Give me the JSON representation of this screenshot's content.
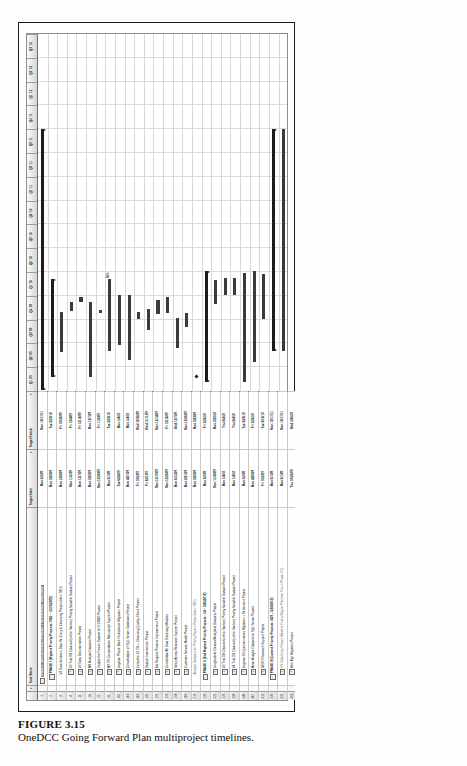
{
  "figure": {
    "label": "FIGURE 3.15",
    "caption": "OneDCC Going Forward Plan multiproject timelines."
  },
  "app": {
    "type": "gantt-chart",
    "columns": {
      "id": "",
      "indicator": "",
      "task_name": "Task Name",
      "target_start": "Target Start",
      "target_finish": "Target Finish"
    },
    "sort_arrow": "▾"
  },
  "timeline": {
    "unit": "quarter",
    "ticks": [
      "Q1 '09",
      "Q2 '09",
      "Q3 '09",
      "Q4 '09",
      "Q1 '10",
      "Q2 '10",
      "Q3 '10",
      "Q4 '10",
      "Q1 '11",
      "Q2 '11",
      "Q3 '11",
      "Q4 '11",
      "Q1 '12",
      "Q2 '12",
      "Q3 '12"
    ]
  },
  "chart_data": {
    "type": "bar",
    "title": "OneDCC Going Forward Plan multiproject timelines",
    "xlabel": "Quarter",
    "ylabel": "Task",
    "categories": [
      "Q1 '09",
      "Q2 '09",
      "Q3 '09",
      "Q4 '09",
      "Q1 '10",
      "Q2 '10",
      "Q3 '10",
      "Q4 '10",
      "Q1 '11",
      "Q2 '11",
      "Q3 '11",
      "Q4 '11",
      "Q1 '12",
      "Q2 '12",
      "Q3 '12"
    ],
    "rows": [
      {
        "id": "1",
        "indent": 0,
        "expander": "-",
        "bold": true,
        "banner": true,
        "name": "OneDCC 2009-2010 MULTIPROJECT INTEGRATED TIMELINES",
        "target_start": "Mon 2/2/09",
        "target_finish": "Mon 10/17/11",
        "start_q": 0.05,
        "end_q": 11.0,
        "kind": "summary"
      },
      {
        "id": "2",
        "indent": 1,
        "expander": "-",
        "bold": true,
        "name": "PHASE I (Highest Priority Projects: 9/26 – 12/19/2009)",
        "target_start": "Mon 3/23/09",
        "target_finish": "Tue 2/23/10",
        "start_q": 0.6,
        "end_q": 4.7,
        "kind": "summary",
        "pct": ""
      },
      {
        "id": "3",
        "indent": 2,
        "expander": "",
        "bold": false,
        "name": "V3 Data Solutions Data Re-Entry & Cleansing Project (New-TBD)",
        "target_start": "Mon 5/28/09",
        "target_finish": "Fri 10/30/09",
        "start_q": 1.62,
        "end_q": 3.32,
        "kind": "bar"
      },
      {
        "id": "4",
        "indent": 2,
        "expander": "+",
        "bold": false,
        "name": "V3 Trial DB Cleaned (within Section) Priority Variable Dataset Project",
        "target_start": "Mon 11/2/09",
        "target_finish": "Fri 12/4/09",
        "start_q": 3.35,
        "end_q": 3.72,
        "kind": "bar"
      },
      {
        "id": "11",
        "indent": 2,
        "expander": "+",
        "bold": false,
        "name": "V3 Data Documentation Project",
        "target_start": "Mon 12/7/09",
        "target_finish": "Fri 12/18/09",
        "start_q": 3.75,
        "end_q": 3.95,
        "kind": "bar"
      },
      {
        "id": "14",
        "indent": 2,
        "expander": "+",
        "bold": false,
        "name": "MB Analytic Datasets Project",
        "target_start": "Mon 3/23/09",
        "target_finish": "Mon 12/7/09",
        "start_q": 0.6,
        "end_q": 3.76,
        "kind": "bar"
      },
      {
        "id": "25",
        "indent": 2,
        "expander": "+",
        "bold": false,
        "name": "Update the Frozen Dataset to 9/1/2009 Project",
        "target_start": "Mon 10/26/09",
        "target_finish": "Fri 11/6/09",
        "start_q": 3.28,
        "end_q": 3.42,
        "kind": "bar"
      },
      {
        "id": "31",
        "indent": 2,
        "expander": "+",
        "bold": false,
        "name": "MR-PII Concordation Manuscript Support Project",
        "target_start": "Mon 6/1/09",
        "target_finish": "Tue 2/23/10",
        "start_q": 1.68,
        "end_q": 4.7,
        "kind": "bar",
        "pct": "95%"
      },
      {
        "id": "83",
        "indent": 2,
        "expander": "+",
        "bold": false,
        "name": "Logician Phone Bank Foreclosure Migration Project",
        "target_start": "Tue 6/26/09",
        "target_finish": "Mon 1/4/10",
        "start_q": 1.95,
        "end_q": 4.02,
        "kind": "bar"
      },
      {
        "id": "102",
        "indent": 2,
        "expander": "+",
        "bold": false,
        "name": "Consolidation of SQL Server Databases Project",
        "target_start": "Mon 4/27/09",
        "target_finish": "Mon 1/4/10",
        "start_q": 1.3,
        "end_q": 4.02,
        "kind": "bar"
      },
      {
        "id": "105",
        "indent": 2,
        "expander": "+",
        "bold": false,
        "name": "Complete V1 DB + Cleansing Quality Check Project",
        "target_start": "Fri 10/2/09",
        "target_finish": "Wed 10/28/09",
        "start_q": 3.02,
        "end_q": 3.3,
        "kind": "bar"
      },
      {
        "id": "150",
        "indent": 2,
        "expander": "+",
        "bold": false,
        "name": "Dataset Inventorium Project",
        "target_start": "Fri 8/21/09",
        "target_finish": "Wed 11/11/09",
        "start_q": 2.57,
        "end_q": 3.45,
        "kind": "bar"
      },
      {
        "id": "191",
        "indent": 2,
        "expander": "+",
        "bold": false,
        "name": "Bia Request Process Improvement Project",
        "target_start": "Mon 10/19/09",
        "target_finish": "Mon 12/14/09",
        "start_q": 3.22,
        "end_q": 3.82,
        "kind": "bar"
      },
      {
        "id": "196",
        "indent": 2,
        "expander": "+",
        "bold": false,
        "name": "Consolidate All Data Dictionary Modules",
        "target_start": "Mon 10/26/09",
        "target_finish": "Fri 12/18/09",
        "start_q": 3.28,
        "end_q": 3.95,
        "kind": "bar"
      },
      {
        "id": "198",
        "indent": 2,
        "expander": "+",
        "bold": false,
        "name": "Sleep Apnea Research Support Project",
        "target_start": "Mon 6/15/09",
        "target_finish": "Wed 10/7/09",
        "start_q": 1.82,
        "end_q": 3.07,
        "kind": "bar"
      },
      {
        "id": "200",
        "indent": 2,
        "expander": "+",
        "bold": false,
        "name": "Customer Service Model Project",
        "target_start": "Mon 8/31/09",
        "target_finish": "Mon 10/26/09",
        "start_q": 2.67,
        "end_q": 3.28,
        "kind": "bar"
      },
      {
        "id": "219",
        "indent": 2,
        "expander": "",
        "bold": false,
        "gray": true,
        "name": "Analytic Datasets for Priority Papers Project (New-TBD)",
        "target_start": "Mon 3/23/09",
        "target_finish": "Mon 3/23/09",
        "start_q": 0.6,
        "end_q": 0.62,
        "kind": "milestone"
      },
      {
        "id": "220",
        "indent": 1,
        "expander": "-",
        "bold": true,
        "name": "PHASE II (2nd Highest Priority Projects: 1/4 – 3/26/2010)",
        "target_start": "Mon 3/2/09",
        "target_finish": "Fri 3/26/10",
        "start_q": 0.38,
        "end_q": 5.05,
        "kind": "summary"
      },
      {
        "id": "221",
        "indent": 2,
        "expander": "+",
        "bold": false,
        "name": "Longitudinal Cleaned Analytical Datasets Project",
        "target_start": "Mon 11/30/09",
        "target_finish": "Mon 2/22/10",
        "start_q": 3.66,
        "end_q": 4.68,
        "kind": "bar"
      },
      {
        "id": "226",
        "indent": 2,
        "expander": "+",
        "bold": false,
        "name": "V3 Trial DB Cleaned (within Section) Priority Variable Dataset Project",
        "target_start": "Mon 1/4/10",
        "target_finish": "Thu 3/4/10",
        "start_q": 4.02,
        "end_q": 4.73,
        "kind": "bar"
      },
      {
        "id": "233",
        "indent": 2,
        "expander": "+",
        "bold": false,
        "name": "V4 Trial DB Cleaned (within Section) Priority Variable Dataset Project",
        "target_start": "Mon 1/4/10",
        "target_finish": "Thu 3/4/10",
        "start_q": 4.02,
        "end_q": 4.73,
        "kind": "bar"
      },
      {
        "id": "240",
        "indent": 2,
        "expander": "+",
        "bold": false,
        "name": "Logician V3 Questionnaires Migration + Retirement Project",
        "target_start": "Mon 3/2/09",
        "target_finish": "Tue 3/23/10",
        "start_q": 0.38,
        "end_q": 4.95,
        "kind": "bar"
      },
      {
        "id": "307",
        "indent": 2,
        "expander": "+",
        "bold": false,
        "name": "Move Analytic Datasets to SQL Server Project",
        "target_start": "Mon 4/20/09",
        "target_finish": "Fri 3/26/10",
        "start_q": 1.22,
        "end_q": 5.05,
        "kind": "bar"
      },
      {
        "id": "312",
        "indent": 2,
        "expander": "+",
        "bold": false,
        "name": "GERD Research Support Project",
        "target_start": "Fri 10/2/09",
        "target_finish": "Tue 3/16/10",
        "start_q": 3.02,
        "end_q": 4.9,
        "kind": "bar"
      },
      {
        "id": "320",
        "indent": 1,
        "expander": "-",
        "bold": true,
        "name": "PHASE III (Lowest Priority Projects: 3/29 - 5/28/2010)",
        "target_start": "Mon 6/1/09",
        "target_finish": "Mon 10/17/11",
        "start_q": 1.68,
        "end_q": 11.0,
        "kind": "summary",
        "pct": ""
      },
      {
        "id": "321",
        "indent": 2,
        "expander": "+",
        "bold": false,
        "gray": true,
        "name": "LIS Data Entry Project (Need to Find a Way to Prioritize This in Phase 1/2)",
        "target_start": "Mon 6/1/09",
        "target_finish": "Mon 10/17/11",
        "start_q": 1.68,
        "end_q": 11.0,
        "kind": "bar"
      },
      {
        "id": "353",
        "indent": 2,
        "expander": "+",
        "bold": false,
        "name": "Web App Migration Project",
        "target_start": "Thu 10/22/09",
        "target_finish": "Wed 5/26/10",
        "start_q": 3.25,
        "end_q": 5.62,
        "kind": "bar"
      },
      {
        "id": "402",
        "indent": 2,
        "expander": "+",
        "bold": false,
        "name": "Systems Documentation Project",
        "target_start": "Mon 2/1/10",
        "target_finish": "Fri 4/30/10",
        "start_q": 4.35,
        "end_q": 5.32,
        "kind": "bar"
      },
      {
        "id": "408",
        "indent": 0,
        "expander": "+",
        "bold": true,
        "banner": true,
        "pool": true,
        "name": "POOL OF PROJECTS THAT MUST BE PRIORITIZED & INSERTED BY PHASE ABOVE",
        "target_start": "Fri 5/21/09",
        "target_finish": "Wed 9/19/12",
        "start_q": 1.55,
        "end_q": 14.3,
        "kind": "summary"
      }
    ]
  }
}
